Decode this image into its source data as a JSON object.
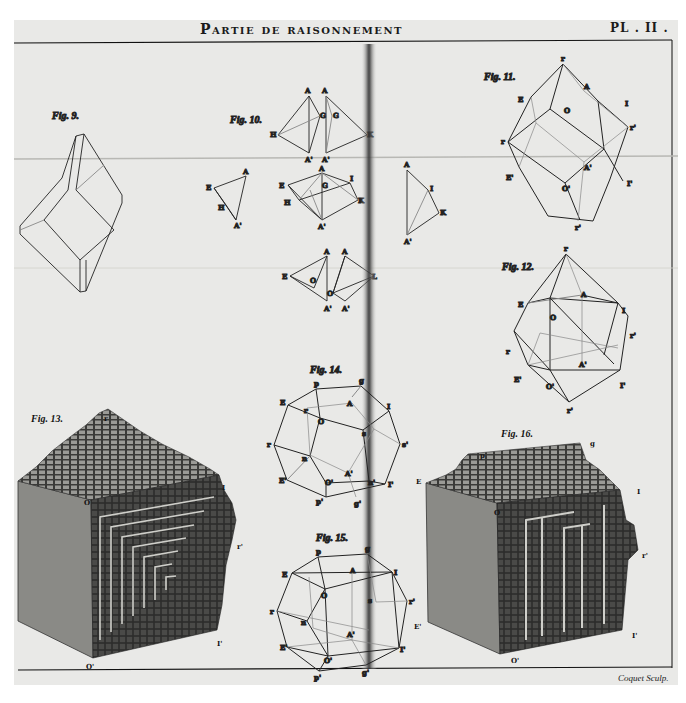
{
  "plate": {
    "title": "Partie de raisonnement",
    "plate_number": "PL . II .",
    "engraver_signature": "Coquet Sculp."
  },
  "figures": [
    {
      "id": "fig-9",
      "caption": "Fig. 9.",
      "labels": [
        "r",
        "r",
        "r",
        "r",
        "r",
        "r"
      ]
    },
    {
      "id": "fig-10",
      "caption": "Fig. 10.",
      "labels": [
        "A",
        "A'",
        "H",
        "G",
        "K",
        "E",
        "I",
        "O",
        "L"
      ]
    },
    {
      "id": "fig-11",
      "caption": "Fig. 11.",
      "labels": [
        "r",
        "E",
        "A",
        "O",
        "I",
        "r'",
        "r",
        "A'",
        "E'",
        "O'",
        "I'",
        "r'"
      ]
    },
    {
      "id": "fig-12",
      "caption": "Fig. 12.",
      "labels": [
        "r",
        "E",
        "A",
        "O",
        "I",
        "r'",
        "r",
        "A'",
        "E'",
        "O'",
        "I'",
        "r'"
      ]
    },
    {
      "id": "fig-13",
      "caption": "Fig. 13.",
      "labels": [
        "r",
        "O",
        "I",
        "r'",
        "O'",
        "I'"
      ]
    },
    {
      "id": "fig-14",
      "caption": "Fig. 14.",
      "labels": [
        "p",
        "g",
        "E",
        "r",
        "A",
        "I",
        "O",
        "s",
        "r",
        "n",
        "s'",
        "E'",
        "A'",
        "O'",
        "n'",
        "I'",
        "p'",
        "g'"
      ]
    },
    {
      "id": "fig-15",
      "caption": "Fig. 15.",
      "labels": [
        "p",
        "g",
        "E",
        "A",
        "I",
        "O",
        "r",
        "n",
        "s",
        "r'",
        "E'",
        "A'",
        "O'",
        "I'",
        "p'",
        "g'"
      ]
    },
    {
      "id": "fig-16",
      "caption": "Fig. 16.",
      "labels": [
        "p",
        "g",
        "E",
        "I",
        "O",
        "r'",
        "E'",
        "I'",
        "O'"
      ]
    }
  ],
  "colors": {
    "paper": "#e9e9e7",
    "ink": "#1a1a1a",
    "fold_shadow": "#3a3a3a",
    "stone_face": "#8a8a86",
    "stepped_face": "#2b2b2b"
  }
}
